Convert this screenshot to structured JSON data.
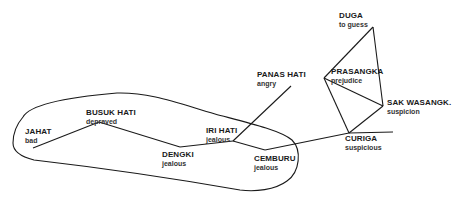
{
  "diagram": {
    "colors": {
      "stroke": "#1a1a1a",
      "background": "#ffffff"
    },
    "nodes": [
      {
        "id": "jahat",
        "term": "JAHAT",
        "gloss": "bad",
        "x": 33,
        "y": 148,
        "label_x": 25,
        "label_y": 127
      },
      {
        "id": "busuk-hati",
        "term": "BUSUK HATI",
        "gloss": "depraved",
        "x": 99,
        "y": 122,
        "label_x": 86,
        "label_y": 108
      },
      {
        "id": "dengki",
        "term": "DENGKI",
        "gloss": "jealous",
        "x": 180,
        "y": 147,
        "label_x": 162,
        "label_y": 150
      },
      {
        "id": "iri-hati",
        "term": "IRI HATI",
        "gloss": "jealous",
        "x": 233,
        "y": 141,
        "label_x": 206,
        "label_y": 126
      },
      {
        "id": "cemburu",
        "term": "CEMBURU",
        "gloss": "jealous",
        "x": 265,
        "y": 150,
        "label_x": 254,
        "label_y": 154
      },
      {
        "id": "panas-hati",
        "term": "PANAS HATI",
        "gloss": "angry",
        "x": 291,
        "y": 86,
        "label_x": 257,
        "label_y": 70
      },
      {
        "id": "curiga",
        "term": "CURIGA",
        "gloss": "suspicious",
        "x": 349,
        "y": 133,
        "label_x": 345,
        "label_y": 134
      },
      {
        "id": "prasangka",
        "term": "PRASANGKA",
        "gloss": "prejudice",
        "x": 324,
        "y": 78,
        "label_x": 331,
        "label_y": 67
      },
      {
        "id": "sak-wasangk",
        "term": "SAK WASANGK.",
        "gloss": "suspicion",
        "x": 383,
        "y": 106,
        "label_x": 387,
        "label_y": 98
      },
      {
        "id": "duga",
        "term": "DUGA",
        "gloss": "to guess",
        "x": 373,
        "y": 27,
        "label_x": 339,
        "label_y": 11
      }
    ],
    "edges": [
      [
        "jahat",
        "busuk-hati"
      ],
      [
        "busuk-hati",
        "dengki"
      ],
      [
        "dengki",
        "iri-hati"
      ],
      [
        "iri-hati",
        "cemburu"
      ],
      [
        "iri-hati",
        "panas-hati"
      ],
      [
        "cemburu",
        "curiga"
      ],
      [
        "curiga",
        "prasangka"
      ],
      [
        "curiga",
        "sak-wasangk"
      ],
      [
        "prasangka",
        "sak-wasangk"
      ],
      [
        "prasangka",
        "duga"
      ],
      [
        "duga",
        "sak-wasangk"
      ]
    ],
    "tail_edge": {
      "from": "curiga",
      "to_x": 393,
      "to_y": 132
    },
    "enclosure_path": "M 23 117 C 30 104, 70 97, 117 93 C 150 92, 180 104, 215 114 C 245 122, 280 130, 292 140 C 302 150, 300 172, 287 181 C 275 190, 255 192, 240 190 C 200 183, 120 170, 34 160 C 22 157, 13 152, 13 143 C 13 133, 17 124, 23 117 Z"
  }
}
